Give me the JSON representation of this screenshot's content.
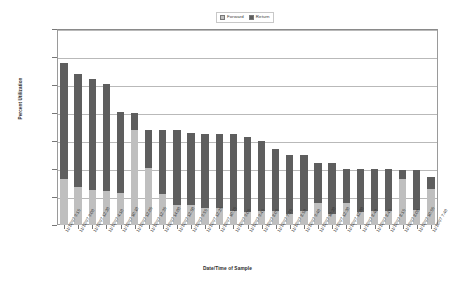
{
  "chart_data": {
    "type": "bar",
    "subtype": "stacked-bar",
    "title": "",
    "xlabel": "Date/Time of Sample",
    "ylabel": "Percent Utilization",
    "ylim": [
      0,
      140
    ],
    "ytick_step": 20,
    "ytick_labels": [
      "0%",
      "20%",
      "40%",
      "60%",
      "80%",
      "100%",
      "120%",
      "140%"
    ],
    "ytick_values": [
      0,
      20,
      40,
      60,
      80,
      100,
      120,
      140
    ],
    "grid": true,
    "legend_position": "top-center",
    "colors": {
      "forward": "#bfbfbf",
      "return": "#5e5e5e",
      "gridline": "#b9b9b9",
      "axis": "#777777",
      "plot_border": "#9a9a9a",
      "background": "#ffffff",
      "text": "#333333"
    },
    "categories": [
      "11/12/97 9:15",
      "11/12/97 9:00",
      "11/12/97 12:20",
      "11/12/97 4:10",
      "11/12/97 10:10",
      "11/12/97 12:05",
      "11/12/97 12:35",
      "11/12/97 14:00",
      "11/12/97 12:50",
      "11/12/97 9:55",
      "11/12/97 12:25",
      "11/12/97 10:15",
      "11/12/97 9:05",
      "11/12/97 9:45",
      "11/12/97 8:05",
      "11/12/97 7:35",
      "11/12/97 8:50",
      "11/12/97 9:40",
      "11/12/97 10:20",
      "11/12/97 12:30",
      "11/12/97 12:00",
      "11/12/97 8:40",
      "11/12/97 8:45",
      "11/12/97 8:15",
      "11/12/97 8:00",
      "11/12/97 10:55",
      "11/12/97 7:40"
    ],
    "series": [
      {
        "name": "Forward",
        "values": [
          33,
          27,
          25,
          24,
          23,
          68,
          41,
          22,
          14,
          14,
          12,
          12,
          10,
          9,
          10,
          10,
          8,
          10,
          16,
          8,
          16,
          9,
          10,
          10,
          33,
          11,
          26
        ]
      },
      {
        "name": "Return",
        "values": [
          83,
          81,
          79,
          77,
          58,
          12,
          27,
          46,
          54,
          52,
          53,
          53,
          55,
          54,
          50,
          44,
          42,
          40,
          28,
          36,
          24,
          31,
          30,
          30,
          6,
          28,
          8
        ]
      }
    ],
    "totals": [
      116,
      108,
      104,
      101,
      81,
      80,
      68,
      68,
      68,
      66,
      65,
      65,
      65,
      63,
      60,
      54,
      50,
      50,
      44,
      44,
      40,
      40,
      40,
      40,
      39,
      39,
      34
    ]
  },
  "legend": {
    "entries": [
      {
        "label": "Forward",
        "key": "forward"
      },
      {
        "label": "Return",
        "key": "return"
      }
    ]
  }
}
